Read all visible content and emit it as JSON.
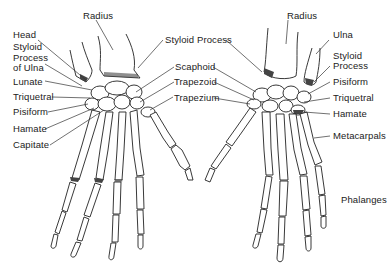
{
  "diagram": {
    "title": "",
    "left_hand": {
      "view": "dorsal",
      "labels": [
        {
          "id": "radius",
          "text": "Radius"
        },
        {
          "id": "head",
          "text": "Head"
        },
        {
          "id": "styloid-ulna-1",
          "text": "Styloid"
        },
        {
          "id": "styloid-ulna-2",
          "text": "Process"
        },
        {
          "id": "styloid-ulna-3",
          "text": "of Ulna"
        },
        {
          "id": "lunate",
          "text": "Lunate"
        },
        {
          "id": "triquetral",
          "text": "Triquetral"
        },
        {
          "id": "pisiform",
          "text": "Pisiform"
        },
        {
          "id": "hamate",
          "text": "Hamate"
        },
        {
          "id": "capitate",
          "text": "Capitate"
        },
        {
          "id": "styloid-process",
          "text": "Styloid Process"
        },
        {
          "id": "scaphoid",
          "text": "Scaphoid"
        },
        {
          "id": "trapezoid",
          "text": "Trapezoid"
        },
        {
          "id": "trapezium",
          "text": "Trapezium"
        }
      ]
    },
    "right_hand": {
      "view": "palmar",
      "labels": [
        {
          "id": "radius",
          "text": "Radius"
        },
        {
          "id": "ulna",
          "text": "Ulna"
        },
        {
          "id": "styloid-1",
          "text": "Styloid"
        },
        {
          "id": "styloid-2",
          "text": "Process"
        },
        {
          "id": "pisiform",
          "text": "Pisiform"
        },
        {
          "id": "triquetral",
          "text": "Triquetral"
        },
        {
          "id": "hamate",
          "text": "Hamate"
        },
        {
          "id": "metacarpals",
          "text": "Metacarpals"
        },
        {
          "id": "phalanges",
          "text": "Phalanges"
        }
      ]
    }
  }
}
